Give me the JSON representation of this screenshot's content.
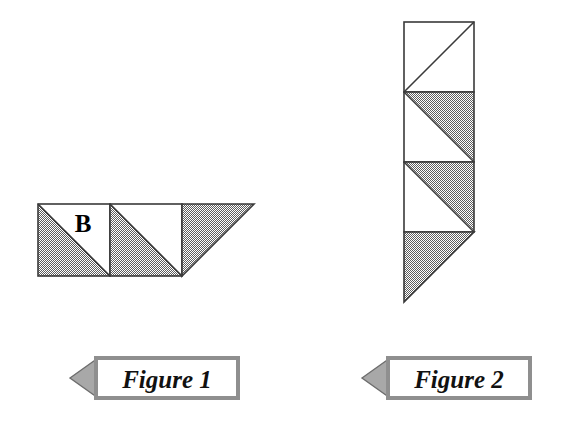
{
  "page": {
    "background_color": "#ffffff",
    "width": 574,
    "height": 434
  },
  "palette": {
    "shaded_fill": "#9a9a9a",
    "unshaded_fill": "#ffffff",
    "outline": "#3a3a3a",
    "banner_arrow_fill": "#a8a8a8",
    "banner_box_fill": "#ffffff",
    "banner_border": "#8f8f8f",
    "text_color": "#111111"
  },
  "figures": [
    {
      "id": "figure-1",
      "caption": "Figure 1",
      "orientation": "horizontal",
      "cell_size": 72,
      "squares": [
        {
          "index": 1,
          "diagonal": "top-left-to-bottom-right",
          "shaded_half": "lower-left",
          "unshaded_half": "upper-right",
          "label": "B"
        },
        {
          "index": 2,
          "diagonal": "top-left-to-bottom-right",
          "shaded_half": "lower-left",
          "unshaded_half": "upper-right",
          "label": ""
        }
      ],
      "terminal_triangle": {
        "shaded": true,
        "right_angle_corner": "top-left",
        "direction": "points-right-down"
      }
    },
    {
      "id": "figure-2",
      "caption": "Figure 2",
      "orientation": "vertical",
      "cell_size": 70,
      "squares": [
        {
          "index": 1,
          "diagonal": "bottom-left-to-top-right",
          "shaded_half": "none",
          "unshaded_half": "both",
          "label": ""
        },
        {
          "index": 2,
          "diagonal": "top-left-to-bottom-right",
          "shaded_half": "upper-right",
          "unshaded_half": "lower-left",
          "label": ""
        },
        {
          "index": 3,
          "diagonal": "top-left-to-bottom-right",
          "shaded_half": "upper-right",
          "unshaded_half": "lower-left",
          "label": ""
        }
      ],
      "terminal_triangle": {
        "shaded": true,
        "right_angle_corner": "top-left",
        "direction": "points-down-left"
      }
    }
  ],
  "banners": [
    {
      "id": "banner-figure-1",
      "label": "Figure 1",
      "arrow_direction": "left"
    },
    {
      "id": "banner-figure-2",
      "label": "Figure 2",
      "arrow_direction": "left"
    }
  ]
}
